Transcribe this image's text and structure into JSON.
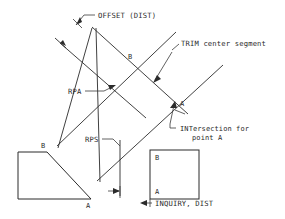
{
  "diagram": {
    "background_color": "#ffffff",
    "line_color": "#2b2b2b",
    "width": 285,
    "height": 219,
    "annotations": [
      {
        "id": "offset-dist",
        "label": "OFFSET (DIST)",
        "x": 98,
        "y": 18,
        "leader": "elbow-with-arrow",
        "points_to": "upper-left parallel construction line"
      },
      {
        "id": "trim-center-segment",
        "label": "TRIM center segment",
        "x": 181,
        "y": 46,
        "leader": "elbow-with-arrow",
        "points_to": "center segment of crossing lines"
      },
      {
        "id": "rpa",
        "label": "RPA",
        "x": 70,
        "y": 93,
        "leader": "horizontal-with-arrow",
        "points_to": "upper crossing intersection"
      },
      {
        "id": "rps",
        "label": "RPS",
        "x": 87,
        "y": 142,
        "leader": "elbow",
        "points_to": "vertical reference line"
      },
      {
        "id": "intersection-for-point-a",
        "label_line1": "INTersection for",
        "label_line2": "point A",
        "x": 180,
        "y": 131,
        "leader": "elbow-with-arrow",
        "points_to": "lower right intersection"
      },
      {
        "id": "inquiry-dist",
        "label": "INQUIRY, DIST",
        "x": 155,
        "y": 206,
        "leader": "left-arrow",
        "points_to": "dimension between vertical line and square"
      }
    ],
    "point_labels": [
      {
        "id": "point-b-upper",
        "label": "B",
        "x": 128,
        "y": 59
      },
      {
        "id": "point-a-right",
        "label": "A",
        "x": 180,
        "y": 106
      },
      {
        "id": "point-b-trapezoid",
        "label": "B",
        "x": 41,
        "y": 148
      },
      {
        "id": "point-a-trapezoid",
        "label": "A",
        "x": 88,
        "y": 206
      },
      {
        "id": "point-b-square",
        "label": "B",
        "x": 155,
        "y": 158
      },
      {
        "id": "point-a-square",
        "label": "A",
        "x": 155,
        "y": 193
      }
    ],
    "shapes": [
      {
        "id": "trapezoid",
        "type": "polygon",
        "description": "open trapezoid at lower left with B at top and A at bottom right"
      },
      {
        "id": "square",
        "type": "rect",
        "description": "square at lower right containing B and A labels"
      }
    ],
    "construction_lines": [
      {
        "id": "offset-line-upper-left",
        "description": "diagonal line from lower-left to upper-right with tick at start"
      },
      {
        "id": "main-diagonal-down-right",
        "description": "diagonal line descending left to right through crossings"
      },
      {
        "id": "diagonal-up-right-long",
        "description": "long diagonal ascending to the right"
      },
      {
        "id": "vertical-reference-line",
        "description": "near-vertical dimension reference line with arrows"
      }
    ]
  }
}
